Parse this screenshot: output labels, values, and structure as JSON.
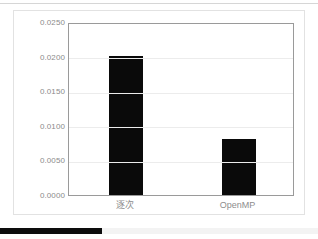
{
  "slide": {
    "background_color": "#ffffff",
    "border_color": "#e2e2e2"
  },
  "bottom_bar": {
    "progress_color": "#0d0d0d",
    "track_color": "#f3f3f3",
    "hint_text": ""
  },
  "chart_data": {
    "type": "bar",
    "title": "",
    "xlabel": "",
    "ylabel": "",
    "categories": [
      "逐次",
      "OpenMP"
    ],
    "values": [
      0.0201,
      0.0081
    ],
    "series": [
      {
        "name": "",
        "values": [
          0.0201,
          0.0081
        ]
      }
    ],
    "ylim": [
      0.0,
      0.025
    ],
    "ytick_values": [
      0.0,
      0.005,
      0.01,
      0.015,
      0.02,
      0.025
    ],
    "ytick_labels": [
      "0.0000",
      "0.0050",
      "0.0100",
      "0.0150",
      "0.0200",
      "0.0250"
    ],
    "grid": true,
    "grid_axis": "y",
    "grid_color": "#ececec",
    "legend": false,
    "bar_color": "#0a0a0a",
    "axis_color": "#9a9a9a",
    "tick_label_color": "#8b8b8b"
  }
}
